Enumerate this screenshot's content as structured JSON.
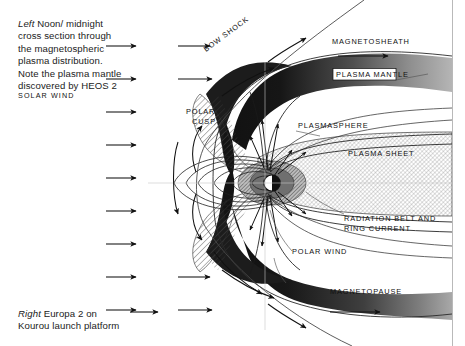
{
  "figure": {
    "captions": {
      "left": {
        "keyword": "Left",
        "text": "Noon/ midnight cross section through the magnetospheric plasma distribution. Note the plasma mantle discovered by HEOS 2"
      },
      "right": {
        "keyword": "Right",
        "text": "Europa 2 on Kourou launch platform"
      }
    },
    "labels": {
      "solar_wind": "SOLAR  WIND",
      "bow_shock": "BOW  SHOCK",
      "magnetosheath": "MAGNETOSHEATH",
      "plasma_mantle": "PLASMA MANTLE",
      "polar_cusp_line1": "POLAR",
      "polar_cusp_line2": "CUSP",
      "plasmasphere": "PLASMASPHERE",
      "plasma_sheet": "PLASMA  SHEET",
      "radiation_belt_line1": "RADIATION  BELT  AND",
      "radiation_belt_line2": "RING  CURRENT",
      "polar_wind": "POLAR  WIND",
      "magnetopause": "MAGNETOPAUSE"
    },
    "colors": {
      "ink": "#111111",
      "paper": "#ffffff",
      "mantle_dark": "#1b1b1b",
      "mantle_mid": "#4a4a4a",
      "mantle_light": "#9a9a9a",
      "hatch": "#4d4d4d",
      "belt_shade": "#6e6e6e"
    }
  }
}
